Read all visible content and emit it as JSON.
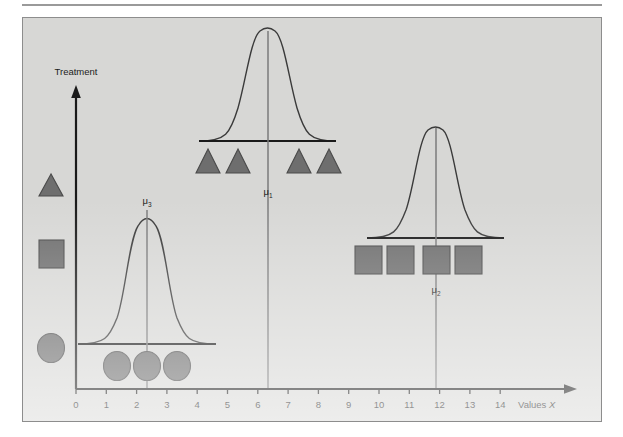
{
  "figure": {
    "background_color": "#d7d7d5",
    "border_color": "#8d8d8d",
    "symbol_fill": "#6e6e6e",
    "symbol_stroke": "#4a4a4a",
    "curve_color": "#3a3a3a",
    "axis_color": "#1a1a1a",
    "mean_line_color": "#7b7b7b"
  },
  "axes": {
    "y_axis_label": "Treatment",
    "x_axis_label_prefix": "Values ",
    "x_axis_label_variable": "X",
    "x_ticks": [
      "0",
      "1",
      "2",
      "3",
      "4",
      "5",
      "6",
      "7",
      "8",
      "9",
      "10",
      "11",
      "12",
      "13",
      "14"
    ],
    "x_tick_values": [
      0,
      1,
      2,
      3,
      4,
      5,
      6,
      7,
      8,
      9,
      10,
      11,
      12,
      13,
      14
    ],
    "x_min": 0,
    "x_max": 14
  },
  "legend": {
    "items": [
      {
        "name": "triangle-legend-symbol",
        "shape": "triangle",
        "treatment": "treatment-1"
      },
      {
        "name": "square-legend-symbol",
        "shape": "square",
        "treatment": "treatment-2"
      },
      {
        "name": "circle-legend-symbol",
        "shape": "circle",
        "treatment": "treatment-3"
      }
    ]
  },
  "chart_data": {
    "type": "line",
    "title": "",
    "subtitle": "",
    "xlabel": "Values X",
    "ylabel": "Treatment",
    "xlim": [
      0,
      14
    ],
    "grid": false,
    "legend_position": "left-outside",
    "annotations": [
      {
        "text": "μ",
        "subscript": "1",
        "x": 6
      },
      {
        "text": "μ",
        "subscript": "2",
        "x": 11.5
      },
      {
        "text": "μ",
        "subscript": "3",
        "x": 2
      }
    ],
    "series": [
      {
        "name": "Treatment 1 distribution",
        "marker": "triangle",
        "mean": 6,
        "mean_label": "μ1",
        "curve_span": [
          4.05,
          8.05
        ],
        "observations": [
          4,
          5,
          7,
          8
        ]
      },
      {
        "name": "Treatment 2 distribution",
        "marker": "square",
        "mean": 11.5,
        "mean_label": "μ2",
        "curve_span": [
          9.55,
          13.55
        ],
        "observations": [
          9.55,
          10.6,
          11.8,
          12.85
        ]
      },
      {
        "name": "Treatment 3 distribution",
        "marker": "circle",
        "mean": 2,
        "mean_label": "μ3",
        "curve_span": [
          0.05,
          4.05
        ],
        "observations": [
          1,
          2,
          3
        ]
      }
    ]
  }
}
